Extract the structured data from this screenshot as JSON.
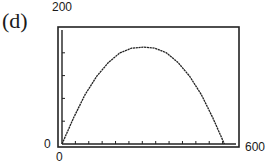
{
  "panel": {
    "label": "(d)"
  },
  "axes": {
    "y_max_label": "200",
    "y_min_label": "0",
    "x_min_label": "0",
    "x_max_label": "600"
  },
  "chart_data": {
    "type": "line",
    "title": "",
    "panel_label": "(d)",
    "xlabel": "",
    "ylabel": "",
    "xlim": [
      0,
      600
    ],
    "ylim": [
      0,
      200
    ],
    "x_tick_labels": [
      "0",
      "600"
    ],
    "y_tick_labels": [
      "0",
      "200"
    ],
    "x_tick_count": 13,
    "y_tick_count": 5,
    "grid": false,
    "legend": null,
    "series": [
      {
        "name": "parabola",
        "description": "downward-opening parabola starting at origin, peaking near x=280, y=170, returning to 0 near x=560",
        "x": [
          0,
          40,
          80,
          120,
          160,
          200,
          240,
          280,
          320,
          360,
          400,
          440,
          480,
          520,
          560
        ],
        "y": [
          0,
          46,
          87,
          119,
          143,
          160,
          168,
          170,
          168,
          160,
          143,
          119,
          87,
          46,
          0
        ]
      }
    ]
  }
}
